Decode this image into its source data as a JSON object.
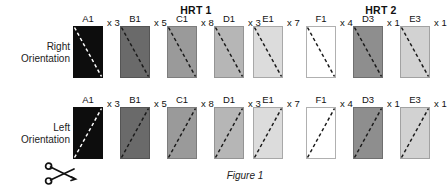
{
  "figure": {
    "caption": "Figure 1",
    "caption_x": 245,
    "caption_y": 170
  },
  "groups": [
    {
      "label": "HRT 1",
      "x": 196,
      "y": 4
    },
    {
      "label": "HRT 2",
      "x": 381,
      "y": 4
    }
  ],
  "rows": [
    {
      "name": "right",
      "label_line1": "Right",
      "label_line2": "Orientation",
      "label_right_edge": 70,
      "label_y": 41,
      "swatch_top": 26,
      "diagonal": "top-left-to-bottom-right"
    },
    {
      "name": "left",
      "label_line1": "Left",
      "label_line2": "Orientation",
      "label_right_edge": 70,
      "label_y": 122,
      "swatch_top": 107,
      "diagonal": "bottom-left-to-top-right"
    }
  ],
  "columns": [
    {
      "label": "A1",
      "multiplier": "x 3",
      "fill": "#0d0d0d",
      "border": "#0d0d0d",
      "dash_color": "#ffffff",
      "x": 73
    },
    {
      "label": "B1",
      "multiplier": "x 5",
      "fill": "#6a6a6a",
      "border": "#555555",
      "dash_color": "#1a1a1a",
      "x": 120
    },
    {
      "label": "C1",
      "multiplier": "x 8",
      "fill": "#9a9a9a",
      "border": "#7d7d7d",
      "dash_color": "#1a1a1a",
      "x": 167
    },
    {
      "label": "D1",
      "multiplier": "x 3",
      "fill": "#b6b6b6",
      "border": "#949494",
      "dash_color": "#1a1a1a",
      "x": 214
    },
    {
      "label": "E1",
      "multiplier": "x 7",
      "fill": "#dcdcdc",
      "border": "#a8a8a8",
      "dash_color": "#1a1a1a",
      "x": 253
    },
    {
      "label": "F1",
      "multiplier": "x 4",
      "fill": "#ffffff",
      "border": "#b0b0b0",
      "dash_color": "#1a1a1a",
      "x": 306
    },
    {
      "label": "D3",
      "multiplier": "x 1",
      "fill": "#8e8e8e",
      "border": "#6f6f6f",
      "dash_color": "#1a1a1a",
      "x": 353
    },
    {
      "label": "E3",
      "multiplier": "x 1",
      "fill": "#d2d2d2",
      "border": "#a2a2a2",
      "dash_color": "#1a1a1a",
      "x": 400
    }
  ],
  "scissors": {
    "name": "scissors-cut-icon",
    "x": 44,
    "y": 161,
    "color": "#111111"
  },
  "swatch_size": {
    "width": 30,
    "height": 52
  }
}
